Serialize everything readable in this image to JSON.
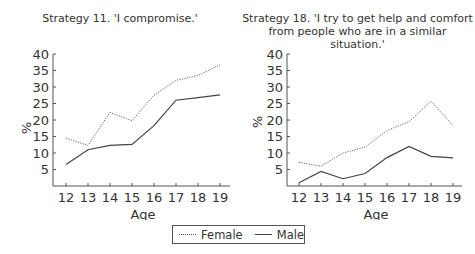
{
  "chart_data": [
    {
      "type": "line",
      "title": "Strategy 11. 'I compromise.'",
      "xlabel": "Age",
      "ylabel": "%",
      "x": [
        12,
        13,
        14,
        15,
        16,
        17,
        18,
        19
      ],
      "yticks": [
        5,
        10,
        15,
        20,
        25,
        30,
        35,
        40
      ],
      "ylim": [
        0,
        40
      ],
      "grid": false,
      "series": [
        {
          "name": "Female",
          "style": "dotted",
          "values": [
            14.5,
            12.3,
            22.3,
            19.8,
            27.5,
            32.0,
            33.5,
            36.7
          ]
        },
        {
          "name": "Male",
          "style": "solid",
          "values": [
            6.5,
            11.0,
            12.3,
            12.6,
            18.3,
            26.0,
            26.8,
            27.6
          ]
        }
      ]
    },
    {
      "type": "line",
      "title": "Strategy 18. 'I try to get help and comfort from people who are in a similar situation.'",
      "title_lines": [
        "Strategy 18. 'I try to get help and comfort",
        "from people who are in a similar situation.'"
      ],
      "xlabel": "Age",
      "ylabel": "%",
      "x": [
        12,
        13,
        14,
        15,
        16,
        17,
        18,
        19
      ],
      "yticks": [
        5,
        10,
        15,
        20,
        25,
        30,
        35,
        40
      ],
      "ylim": [
        0,
        40
      ],
      "grid": false,
      "series": [
        {
          "name": "Female",
          "style": "dotted",
          "values": [
            7.2,
            6.0,
            10.0,
            11.8,
            16.8,
            19.5,
            25.7,
            18.3
          ]
        },
        {
          "name": "Male",
          "style": "solid",
          "values": [
            1.0,
            4.4,
            2.2,
            3.8,
            8.6,
            12.0,
            9.0,
            8.5
          ]
        }
      ]
    }
  ],
  "legend": {
    "position": "bottom-center",
    "entries": [
      {
        "label": "Female",
        "style": "dotted"
      },
      {
        "label": "Male",
        "style": "solid"
      }
    ]
  }
}
